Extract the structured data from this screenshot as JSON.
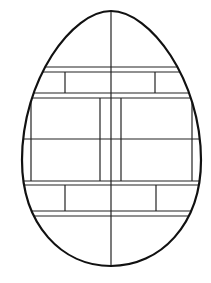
{
  "image": {
    "subject": "egg coloring page with geometric line pattern",
    "width": 211,
    "height": 283,
    "background": "#ffffff",
    "stroke": "#111111"
  },
  "egg": {
    "cx": 111,
    "top": 11,
    "bottom": 266,
    "left": 22,
    "right": 201
  },
  "pattern": {
    "center_vertical_x": 111,
    "upper_band": {
      "y1": 67,
      "y2": 72,
      "y3": 93,
      "y4": 98,
      "dividers_x": [
        65,
        155
      ]
    },
    "middle_block": {
      "top": 98,
      "bottom": 181,
      "mid_y": 139,
      "inner_left_x": 31,
      "inner_right_x": 192,
      "center_cols_x": [
        100,
        121
      ]
    },
    "lower_band": {
      "y1": 181,
      "y2": 185,
      "y3": 211,
      "y4": 216,
      "dividers_x": [
        65,
        156
      ]
    }
  }
}
